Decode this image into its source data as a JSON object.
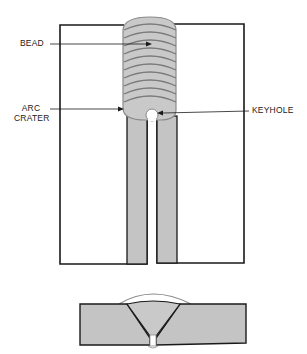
{
  "diagram": {
    "type": "welding keyhole technique illustration",
    "views": [
      "top view of butt joint with weld bead",
      "cross-section of welded joint"
    ],
    "labels": {
      "bead": "BEAD",
      "arc_crater_line1": "ARC",
      "arc_crater_line2": "CRATER",
      "keyhole": "KEYHOLE"
    },
    "colors": {
      "outline": "#1a1a1a",
      "bead_fill": "#c9c9c9",
      "bead_ripple": "#7a7a7a",
      "plate_edge_fill": "#c4c4c4",
      "background": "#ffffff"
    },
    "bead_ripple_count": 10
  }
}
